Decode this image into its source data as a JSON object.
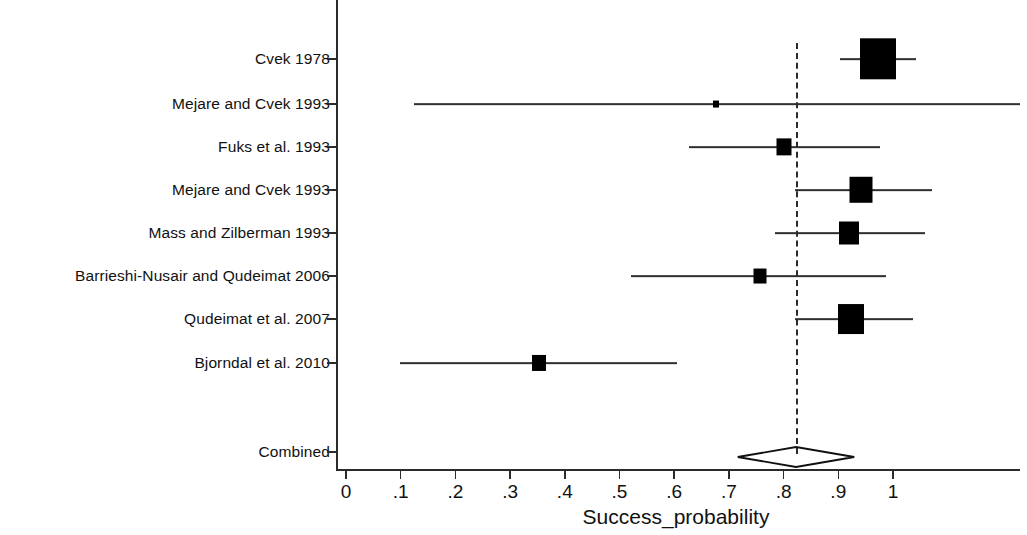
{
  "chart_data": {
    "type": "scatter",
    "plot_kind": "forest-plot",
    "title": "",
    "xlabel": "Success_probability",
    "ylabel": "",
    "xlim": [
      0,
      1.25
    ],
    "xticks": [
      0,
      0.1,
      0.2,
      0.3,
      0.4,
      0.5,
      0.6,
      0.7,
      0.8,
      0.9,
      1
    ],
    "xticklabels": [
      "0",
      ".1",
      ".2",
      ".3",
      ".4",
      ".5",
      ".6",
      ".7",
      ".8",
      ".9",
      "1"
    ],
    "grid": false,
    "legend": "none",
    "reference_line": 0.823,
    "studies": [
      {
        "label": "Cvek 1978",
        "estimate": 0.973,
        "ci_low": 0.904,
        "ci_high": 1.042,
        "weight_box": 36
      },
      {
        "label": "Mejare and Cvek 1993",
        "estimate": 0.676,
        "ci_low": 0.124,
        "ci_high": 1.232,
        "weight_box": 6
      },
      {
        "label": "Fuks et al. 1993",
        "estimate": 0.8,
        "ci_low": 0.627,
        "ci_high": 0.976,
        "weight_box": 15
      },
      {
        "label": "Mejare and Cvek 1993",
        "estimate": 0.941,
        "ci_low": 0.821,
        "ci_high": 1.071,
        "weight_box": 23
      },
      {
        "label": "Mass and Zilberman 1993",
        "estimate": 0.92,
        "ci_low": 0.784,
        "ci_high": 1.058,
        "weight_box": 20
      },
      {
        "label": "Barrieshi-Nusair and Qudeimat 2006",
        "estimate": 0.756,
        "ci_low": 0.521,
        "ci_high": 0.988,
        "weight_box": 13
      },
      {
        "label": "Qudeimat et al. 2007",
        "estimate": 0.924,
        "ci_low": 0.821,
        "ci_high": 1.036,
        "weight_box": 26
      },
      {
        "label": "Bjorndal et al. 2010",
        "estimate": 0.352,
        "ci_low": 0.099,
        "ci_high": 0.605,
        "weight_box": 14
      }
    ],
    "combined": {
      "label": "Combined",
      "estimate": 0.823,
      "ci_low": 0.714,
      "ci_high": 0.927
    }
  }
}
